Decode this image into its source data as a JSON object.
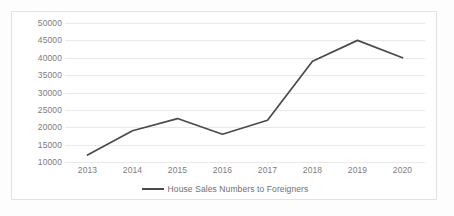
{
  "chart_data": {
    "type": "line",
    "title": "",
    "xlabel": "",
    "ylabel": "",
    "categories": [
      "2013",
      "2014",
      "2015",
      "2016",
      "2017",
      "2018",
      "2019",
      "2020"
    ],
    "series": [
      {
        "name": "House Sales Numbers to Foreigners",
        "values": [
          12000,
          19000,
          22500,
          18000,
          22000,
          39000,
          45000,
          40000
        ],
        "color": "#4a4a4a"
      }
    ],
    "ylim": [
      5000,
      50000
    ],
    "yticks": [
      10000,
      15000,
      20000,
      25000,
      30000,
      35000,
      40000,
      45000,
      50000
    ],
    "ytick_labels": [
      "10000",
      "15000",
      "20000",
      "25000",
      "30000",
      "35000",
      "40000",
      "45000",
      "50000"
    ],
    "grid": true,
    "grid_color": "#e9e9e9",
    "legend": {
      "position": "bottom",
      "entries": [
        {
          "label": "House Sales Numbers to Foreigners",
          "marker": "line-swatch",
          "color": "#4a4a4a"
        }
      ]
    },
    "border_color": "#e2e2e2",
    "background": "#ffffff",
    "axis_label_color": "#7c7c7c"
  }
}
